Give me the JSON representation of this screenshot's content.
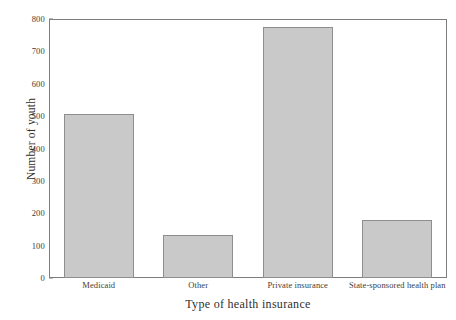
{
  "chart_data": {
    "type": "bar",
    "title": "",
    "categories": [
      "Medicaid",
      "Other",
      "Private insurance",
      "State-sponsored health plan"
    ],
    "values": [
      508,
      132,
      775,
      178
    ],
    "xlabel": "Type of health insurance",
    "ylabel": "Number of youth",
    "ylim": [
      0,
      800
    ],
    "ytick_labels": [
      "0",
      "100",
      "200",
      "300",
      "400",
      "500",
      "600",
      "700",
      "800"
    ],
    "ytick_values": [
      0,
      100,
      200,
      300,
      400,
      500,
      600,
      700,
      800
    ],
    "ytick_step": 100,
    "grid": false,
    "legend": "none",
    "bar_fill_color": "#c9c9c9",
    "bar_border_color": "#8e8e8e",
    "axis_color": "#7d7d7d",
    "background_color": "#ffffff"
  }
}
